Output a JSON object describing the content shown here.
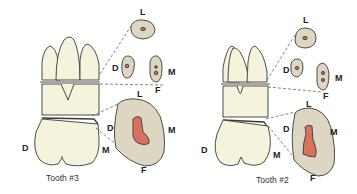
{
  "colors": {
    "enamel": "#f6f3dc",
    "section": "#ddd6c2",
    "pulp": "#d9715f",
    "outline": "#3a3a3a",
    "background": "#ffffff"
  },
  "panels": [
    {
      "caption": "Tooth #3",
      "crown_labels": {
        "distal": "D",
        "mesial": "M"
      },
      "sections": {
        "palatal_root": {
          "label_top": "L"
        },
        "buccal_roots": {
          "label_left": "D",
          "label_right": "M",
          "label_bottom": "F"
        },
        "cervical": {
          "label_top": "L",
          "label_left": "D",
          "label_right": "M",
          "label_bottom": "F"
        }
      }
    },
    {
      "caption": "Tooth #2",
      "crown_labels": {
        "distal": "D",
        "mesial": "M"
      },
      "sections": {
        "palatal_root": {
          "label_top": "L"
        },
        "buccal_roots": {
          "label_left": "D",
          "label_right": "M",
          "label_bottom": "F"
        },
        "cervical": {
          "label_top": "L",
          "label_left": "D",
          "label_right": "M",
          "label_bottom": "F"
        }
      }
    }
  ]
}
